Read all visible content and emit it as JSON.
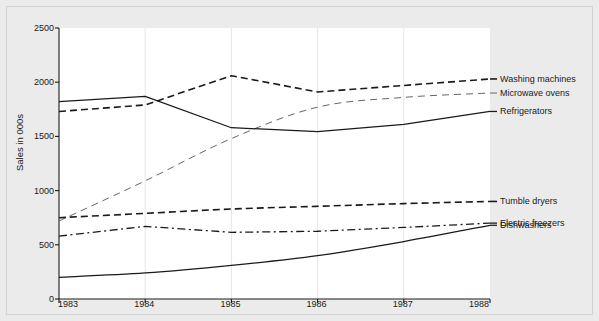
{
  "chart_data": {
    "type": "line",
    "title": "",
    "xlabel": "",
    "ylabel": "Sales in 000s",
    "categories": [
      "1983",
      "1984",
      "1985",
      "1986",
      "1987",
      "1988"
    ],
    "x": [
      1983,
      1984,
      1985,
      1986,
      1987,
      1988
    ],
    "xlim": [
      1983,
      1988
    ],
    "ylim": [
      0,
      2500
    ],
    "yticks": [
      "0",
      "500",
      "1000",
      "1500",
      "2000",
      "2500"
    ],
    "ytick_values": [
      0,
      500,
      1000,
      1500,
      2000,
      2500
    ],
    "grid": "vertical-only",
    "legend_position": "right-of-plot-inline",
    "series": [
      {
        "name": "Washing machines",
        "style": "dashed-bold",
        "color": "#1a1a1a",
        "values": [
          1730,
          1790,
          2060,
          1910,
          1970,
          2030
        ]
      },
      {
        "name": "Microwave ovens",
        "style": "dashed-light",
        "color": "#555555",
        "values": [
          720,
          1090,
          1480,
          1770,
          1860,
          1900
        ]
      },
      {
        "name": "Refrigerators",
        "style": "solid",
        "color": "#1a1a1a",
        "values": [
          1820,
          1870,
          1580,
          1545,
          1610,
          1730
        ]
      },
      {
        "name": "Tumble dryers",
        "style": "dashed-bold",
        "color": "#1a1a1a",
        "values": [
          750,
          790,
          830,
          855,
          880,
          900
        ]
      },
      {
        "name": "Electric freezers",
        "style": "dash-dot",
        "color": "#1a1a1a",
        "values": [
          580,
          670,
          615,
          625,
          660,
          700
        ]
      },
      {
        "name": "Dishwashers",
        "style": "solid",
        "color": "#1a1a1a",
        "values": [
          200,
          240,
          310,
          400,
          530,
          680
        ]
      }
    ]
  },
  "axes": {
    "y_title": "Sales in 000s"
  }
}
